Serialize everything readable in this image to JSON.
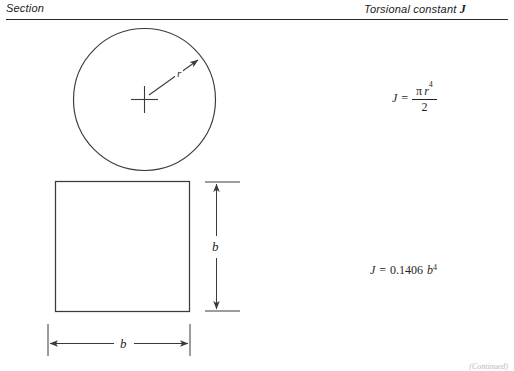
{
  "header": {
    "left_label": "Section",
    "right_label_prefix": "Torsional constant ",
    "right_label_symbol": "J"
  },
  "figure": {
    "rows": [
      {
        "id": "circle-row",
        "shape": "circle",
        "shape_name": "solid-circular-section",
        "dimension_label": "r",
        "dimension_meaning": "radius",
        "center_mark": "cross",
        "formula": {
          "lhs": "J",
          "equals": "=",
          "numerator_pi": "π",
          "numerator_var": "r",
          "numerator_exponent": "4",
          "denominator": "2",
          "plain": "J = π r^4 / 2"
        }
      },
      {
        "id": "square-row",
        "shape": "square",
        "shape_name": "solid-square-section",
        "dimension_label_vertical": "b",
        "dimension_label_horizontal": "b",
        "formula": {
          "lhs": "J",
          "equals": "=",
          "coefficient": "0.1406",
          "variable": "b",
          "exponent": "4",
          "plain": "J = 0.1406 b^4"
        }
      }
    ]
  },
  "footer": {
    "note": "(Continued)"
  },
  "colors": {
    "ink": "#1f1f1f",
    "rule": "#2b2b2b",
    "stroke": "#3a3a3a",
    "background": "#ffffff",
    "footer": "#b8b8b8"
  }
}
